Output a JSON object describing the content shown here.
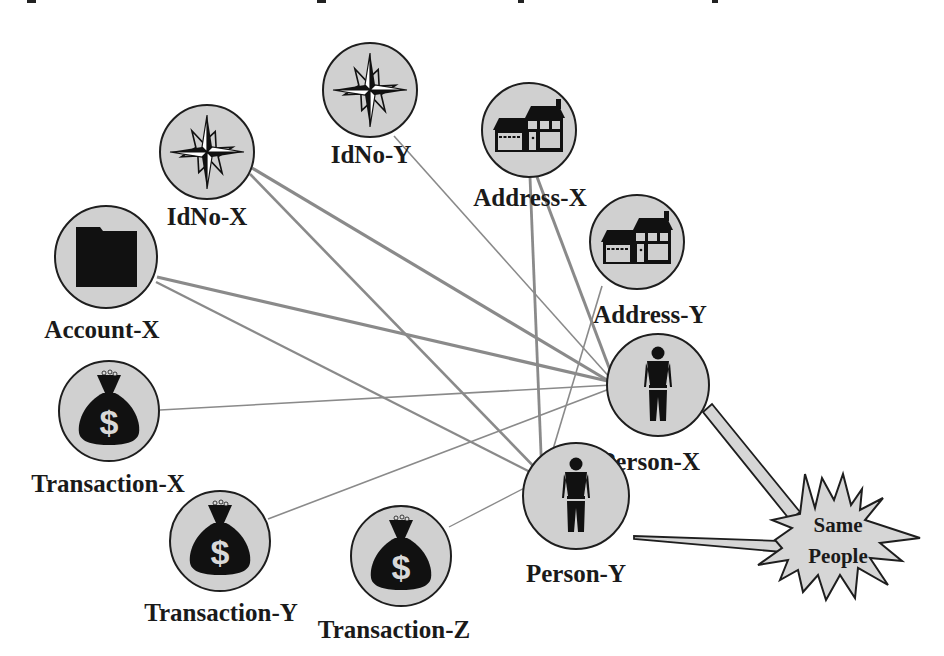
{
  "diagram": {
    "type": "entity-link-graph",
    "nodes": [
      {
        "id": "idno-x",
        "label": "IdNo-X",
        "icon": "compass-star-icon",
        "cx": 207,
        "cy": 152,
        "r": 47,
        "lx": 207,
        "ly": 225
      },
      {
        "id": "idno-y",
        "label": "IdNo-Y",
        "icon": "compass-star-icon",
        "cx": 370,
        "cy": 90,
        "r": 47,
        "lx": 371,
        "ly": 163
      },
      {
        "id": "address-x",
        "label": "Address-X",
        "icon": "house-icon",
        "cx": 529,
        "cy": 130,
        "r": 47,
        "lx": 530,
        "ly": 206
      },
      {
        "id": "address-y",
        "label": "Address-Y",
        "icon": "house-icon",
        "cx": 637,
        "cy": 242,
        "r": 47,
        "lx": 650,
        "ly": 323
      },
      {
        "id": "account-x",
        "label": "Account-X",
        "icon": "folder-icon",
        "cx": 106,
        "cy": 257,
        "r": 51,
        "lx": 102,
        "ly": 338
      },
      {
        "id": "transaction-x",
        "label": "Transaction-X",
        "icon": "money-bag-icon",
        "cx": 109,
        "cy": 411,
        "r": 50,
        "lx": 108,
        "ly": 492
      },
      {
        "id": "transaction-y",
        "label": "Transaction-Y",
        "icon": "money-bag-icon",
        "cx": 220,
        "cy": 541,
        "r": 50,
        "lx": 221,
        "ly": 621
      },
      {
        "id": "transaction-z",
        "label": "Transaction-Z",
        "icon": "money-bag-icon",
        "cx": 401,
        "cy": 556,
        "r": 50,
        "lx": 394,
        "ly": 638
      },
      {
        "id": "person-x",
        "label": "Person-X",
        "icon": "person-icon",
        "cx": 658,
        "cy": 385,
        "r": 51,
        "lx": 650,
        "ly": 470
      },
      {
        "id": "person-y",
        "label": "Person-Y",
        "icon": "person-icon",
        "cx": 576,
        "cy": 496,
        "r": 53,
        "lx": 576,
        "ly": 582
      }
    ],
    "edges": [
      {
        "from": "idno-x",
        "to": "person-x",
        "x1": 252,
        "y1": 168,
        "x2": 612,
        "y2": 383,
        "w": 3.2,
        "dark": true
      },
      {
        "from": "idno-x",
        "to": "person-y",
        "x1": 250,
        "y1": 174,
        "x2": 543,
        "y2": 476,
        "w": 2.6,
        "dark": false
      },
      {
        "from": "idno-y",
        "to": "person-x",
        "x1": 394,
        "y1": 136,
        "x2": 612,
        "y2": 380,
        "w": 1.6,
        "dark": false
      },
      {
        "from": "address-x",
        "to": "person-x",
        "x1": 537,
        "y1": 177,
        "x2": 613,
        "y2": 378,
        "w": 3,
        "dark": true
      },
      {
        "from": "address-x",
        "to": "person-y",
        "x1": 530,
        "y1": 177,
        "x2": 542,
        "y2": 478,
        "w": 2.8,
        "dark": false
      },
      {
        "from": "address-y",
        "to": "person-y",
        "x1": 602,
        "y1": 286,
        "x2": 545,
        "y2": 476,
        "w": 1.6,
        "dark": false
      },
      {
        "from": "account-x",
        "to": "person-x",
        "x1": 157,
        "y1": 277,
        "x2": 612,
        "y2": 382,
        "w": 3.2,
        "dark": true
      },
      {
        "from": "account-x",
        "to": "person-y",
        "x1": 156,
        "y1": 282,
        "x2": 542,
        "y2": 478,
        "w": 2.4,
        "dark": false
      },
      {
        "from": "transaction-x",
        "to": "person-x",
        "x1": 160,
        "y1": 410,
        "x2": 612,
        "y2": 385,
        "w": 1.6,
        "dark": false
      },
      {
        "from": "transaction-y",
        "to": "person-x",
        "x1": 268,
        "y1": 519,
        "x2": 612,
        "y2": 388,
        "w": 1.6,
        "dark": false
      },
      {
        "from": "transaction-z",
        "to": "person-y",
        "x1": 449,
        "y1": 527,
        "x2": 540,
        "y2": 480,
        "w": 1.4,
        "dark": false
      }
    ],
    "callout": {
      "id": "same-people",
      "line1": "Same",
      "line2": "People",
      "cx": 838,
      "cy": 533,
      "points_from": [
        "person-x",
        "person-y"
      ]
    },
    "colors": {
      "node_fill": "#d0d0d0",
      "node_stroke": "#1e1e1e",
      "edge": "#8a8a8a",
      "edge_dark": "#6e6e6e",
      "icon": "#111111",
      "callout_fill": "#d6d6d6",
      "label": "#1a1a1a"
    }
  }
}
